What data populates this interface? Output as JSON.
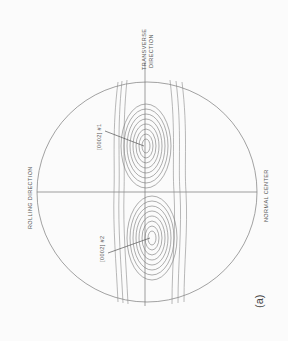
{
  "figure": {
    "panel_label": "(a)",
    "orientation": "rotated 90 degrees counter-clockwise",
    "axes": {
      "rolling_direction": "ROLLING DIRECTION",
      "transverse_direction_line1": "TRANSVERSE",
      "transverse_direction_line2": "DIRECTION",
      "normal_center": "NORMAL CENTER"
    },
    "poles": [
      {
        "label": "[0002] #1"
      },
      {
        "label": "[0002] #2"
      }
    ],
    "colors": {
      "background": "#fbfbfb",
      "lines": "#8a8a8a",
      "text": "#555555"
    }
  }
}
